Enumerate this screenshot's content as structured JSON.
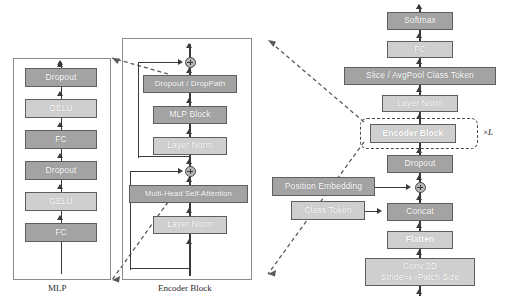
{
  "figure": {
    "colors": {
      "box_dark": "#a3a3a3",
      "box_light": "#cfcfcf",
      "box_border": "#5e5e5e",
      "line": "#3a3a3a",
      "panel_border": "#8c8c8c",
      "dashed": "#4a4a4a",
      "text": "#ffffff",
      "background": "#ffffff"
    }
  },
  "mlp_panel": {
    "caption": "MLP",
    "blocks": [
      {
        "label": "Dropout",
        "shade": "dark"
      },
      {
        "label": "GELU",
        "shade": "light"
      },
      {
        "label": "FC",
        "shade": "dark"
      },
      {
        "label": "Dropout",
        "shade": "dark"
      },
      {
        "label": "GELU",
        "shade": "light"
      },
      {
        "label": "FC",
        "shade": "dark"
      }
    ]
  },
  "encoder_panel": {
    "caption": "Encoder Block",
    "blocks": [
      {
        "label": "Dropout / DropPath",
        "shade": "dark"
      },
      {
        "label": "MLP Block",
        "shade": "dark"
      },
      {
        "label": "Layer Norm",
        "shade": "light"
      },
      {
        "label": "Multi-Head Self-Attention",
        "shade": "dark"
      },
      {
        "label": "Layer Norm",
        "shade": "light"
      }
    ],
    "add_nodes": [
      {
        "name": "mlp-residual-add",
        "symbol": "+"
      },
      {
        "name": "attention-residual-add",
        "symbol": "+"
      }
    ]
  },
  "vit_pipeline": {
    "blocks": [
      {
        "label": "Softmax",
        "shade": "dark",
        "bold": false
      },
      {
        "label": "FC",
        "shade": "light",
        "bold": false
      },
      {
        "label": "Slice / AvgPool Class Token",
        "shade": "dark",
        "bold": false
      },
      {
        "label": "Layer Norm",
        "shade": "light",
        "bold": false
      },
      {
        "label": "Encoder Block",
        "shade": "light",
        "bold": true
      },
      {
        "label": "Dropout",
        "shade": "dark",
        "bold": false
      },
      {
        "label": "Concat",
        "shade": "dark",
        "bold": false
      },
      {
        "label": "Flatten",
        "shade": "light",
        "bold": true
      }
    ],
    "conv_block": {
      "line1": "Conv 2D",
      "line2_prefix": "Stride=",
      "line2_italic": "k",
      "line2_suffix": "=Patch Size",
      "shade": "light"
    },
    "side_inputs": [
      {
        "label": "Position Embedding",
        "shade": "dark",
        "target": "position-add-node"
      },
      {
        "label": "Class Token",
        "shade": "light",
        "target": "concat-block"
      }
    ],
    "repeat_marker": {
      "prefix": "×",
      "italic": "L"
    },
    "add_nodes": [
      {
        "name": "position-add-node",
        "symbol": "+"
      }
    ]
  }
}
